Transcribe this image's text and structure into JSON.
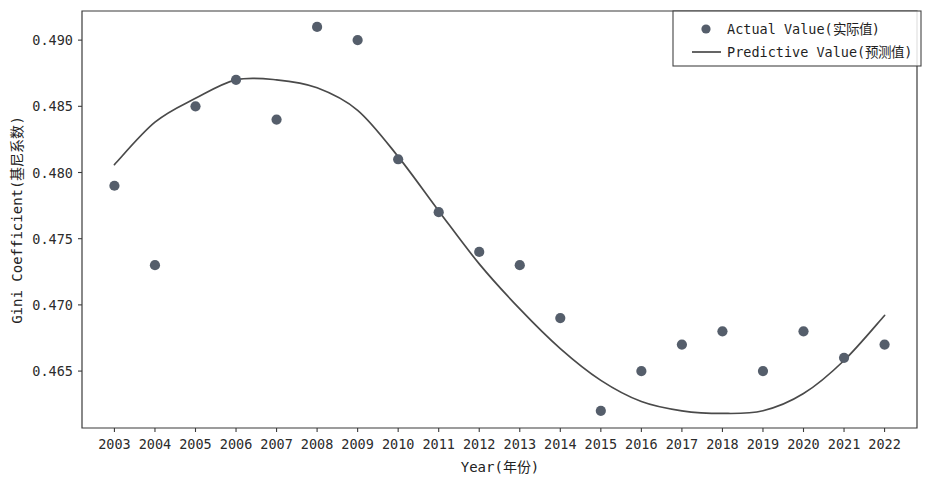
{
  "chart_data": {
    "type": "scatter",
    "title": "",
    "xlabel": "Year(年份)",
    "ylabel": "Gini Coefficient(基尼系数)",
    "x": [
      2003,
      2004,
      2005,
      2006,
      2007,
      2008,
      2009,
      2010,
      2011,
      2012,
      2013,
      2014,
      2015,
      2016,
      2017,
      2018,
      2019,
      2020,
      2021,
      2022
    ],
    "xtick_labels": [
      "2003",
      "2004",
      "2005",
      "2006",
      "2007",
      "2008",
      "2009",
      "2010",
      "2011",
      "2012",
      "2013",
      "2014",
      "2015",
      "2016",
      "2017",
      "2018",
      "2019",
      "2020",
      "2021",
      "2022"
    ],
    "ytick_labels": [
      "0.465",
      "0.470",
      "0.475",
      "0.480",
      "0.485",
      "0.490"
    ],
    "ytick_values": [
      0.465,
      0.47,
      0.475,
      0.48,
      0.485,
      0.49
    ],
    "xlim": [
      2002.2,
      2022.8
    ],
    "ylim": [
      0.4607,
      0.4922
    ],
    "grid": false,
    "legend_position": "top-right",
    "series": [
      {
        "name": "Actual Value(实际值)",
        "marker": "circle",
        "color": "#555e6b",
        "values": [
          0.479,
          0.473,
          0.485,
          0.487,
          0.484,
          0.491,
          0.49,
          0.481,
          0.477,
          0.474,
          0.473,
          0.469,
          0.462,
          0.465,
          0.467,
          0.468,
          0.465,
          0.468,
          0.466,
          0.467
        ]
      },
      {
        "name": "Predictive Value(预测值)",
        "marker": "line",
        "color": "#4a4a4a",
        "values": [
          0.4806,
          0.4838,
          0.4856,
          0.487,
          0.487,
          0.4864,
          0.4847,
          0.4812,
          0.4771,
          0.4731,
          0.4697,
          0.4667,
          0.4643,
          0.4627,
          0.462,
          0.4618,
          0.462,
          0.4633,
          0.4658,
          0.4692
        ]
      }
    ]
  },
  "legend": {
    "entries": [
      {
        "label": "Actual Value(实际值)",
        "kind": "marker"
      },
      {
        "label": "Predictive Value(预测值)",
        "kind": "line"
      }
    ]
  },
  "colors": {
    "marker": "#555e6b",
    "line": "#4a4a4a",
    "axis": "#3b3b3b",
    "background": "#ffffff"
  }
}
